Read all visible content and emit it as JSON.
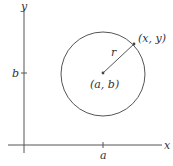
{
  "diagram": {
    "axes": {
      "x_label": "x",
      "y_label": "y",
      "x_tick_label": "a",
      "y_tick_label": "b"
    },
    "circle": {
      "center_label": "(a, b)",
      "point_label": "(x, y)",
      "radius_label": "r"
    },
    "colors": {
      "axis": "#555555",
      "circle": "#555555",
      "text": "#333333"
    }
  }
}
